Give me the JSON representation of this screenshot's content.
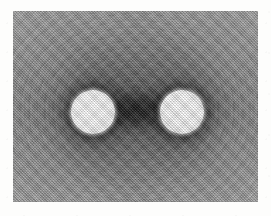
{
  "figure": {
    "kind": "grayscale-field-micrograph",
    "panel": {
      "background_color": "#8b8b8b",
      "dark_color": "#1a1a1a",
      "light_color": "#ffffff",
      "x": 13,
      "y": 11,
      "width": 245,
      "height": 191,
      "texture": "halftone-dither",
      "contours": "concentric-arcs"
    },
    "page_background": "#fdfdfc",
    "objects": [
      {
        "name": "disc-left",
        "shape": "circle",
        "fill": "#ffffff",
        "halo": "dark",
        "center_x": 80,
        "center_y": 101,
        "radius": 22
      },
      {
        "name": "disc-right",
        "shape": "circle",
        "fill": "#ffffff",
        "halo": "dark",
        "center_x": 169,
        "center_y": 101,
        "radius": 22
      }
    ],
    "features": [
      {
        "name": "bridge-saddle",
        "description": "dark saddle region between the two discs"
      },
      {
        "name": "outer-contour-field",
        "description": "concentric contour fringes surrounding the pair"
      }
    ],
    "labels": [],
    "caption": ""
  }
}
